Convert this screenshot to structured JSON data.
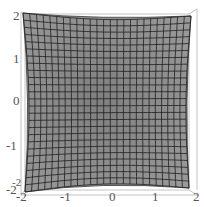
{
  "chart_data": {
    "type": "surface3d",
    "title": "",
    "view": "top-down perspective",
    "x_ticks": [
      "-2",
      "-1",
      "0",
      "1",
      "2"
    ],
    "y_ticks": [
      "2",
      "1",
      "0",
      "-1",
      "-2"
    ],
    "x_range": [
      -2,
      2
    ],
    "y_range": [
      -2,
      2
    ],
    "z_tick_overlap": "-2",
    "mesh_divisions": 25,
    "surface_color": "#8c8c8c",
    "mesh_color": "#1e1e1e",
    "box_color": "#bdbdbd",
    "xlabel": "",
    "ylabel": ""
  }
}
